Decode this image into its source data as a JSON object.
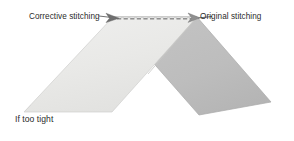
{
  "figure": {
    "title": "If too tight",
    "labels": {
      "corrective_stitching": "Corrective stitching",
      "original_stitching": "Original stitching",
      "caption": "If too tight"
    },
    "colors": {
      "left_panel_fill": "#e9e9e7",
      "left_panel_edge": "#cfcfcd",
      "right_panel_fill": "#bdbdbd",
      "right_panel_edge": "#a9a9a9",
      "stitch_line": "#8c8c8c",
      "leader_line": "#4d4d4d",
      "text": "#2b2b2b",
      "background": "#ffffff"
    },
    "geometry": {
      "left_panel_points": "113,17 197,17 112,112 24,112",
      "right_panel_points": "113,17 197,17 271,102 199,115",
      "stitch_dash_start_x": 117,
      "stitch_dash_end_x": 193,
      "stitch_dash_y": 18,
      "v_notch_x": 148,
      "v_notch_y": 74
    },
    "icons": {
      "corrective_arrow": "arrowhead-right-icon",
      "original_arrow": "arrowhead-left-icon"
    }
  }
}
